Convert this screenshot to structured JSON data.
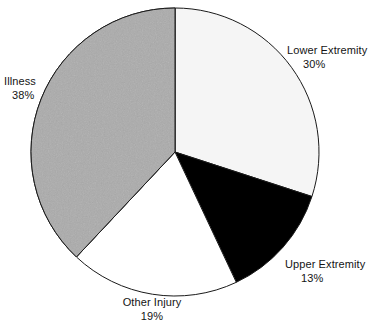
{
  "chart_data": {
    "type": "pie",
    "title": "",
    "subtitle": "",
    "xlabel": "",
    "ylabel": "",
    "legend_position": "none",
    "grid": false,
    "units": "percent",
    "start_angle_deg": 0,
    "direction": "clockwise",
    "total": 100,
    "categories": [
      "Lower Extremity",
      "Upper Extremity",
      "Other Injury",
      "Illness"
    ],
    "values": [
      30,
      13,
      19,
      38
    ],
    "slices": [
      {
        "label": "Lower Extremity",
        "value": 30,
        "value_text": "30%",
        "fill": "#f5f5f5",
        "stroke": "#1a1a1a",
        "pattern": "solid",
        "start_deg": 0,
        "end_deg": 108
      },
      {
        "label": "Upper Extremity",
        "value": 13,
        "value_text": "13%",
        "fill": "#000000",
        "stroke": "#1a1a1a",
        "pattern": "solid",
        "start_deg": 108,
        "end_deg": 154.8
      },
      {
        "label": "Other Injury",
        "value": 19,
        "value_text": "19%",
        "fill": "#ffffff",
        "stroke": "#1a1a1a",
        "pattern": "solid",
        "start_deg": 154.8,
        "end_deg": 223.2
      },
      {
        "label": "Illness",
        "value": 38,
        "value_text": "38%",
        "fill": "#ababab",
        "stroke": "#1a1a1a",
        "pattern": "noise",
        "start_deg": 223.2,
        "end_deg": 360
      }
    ],
    "geometry": {
      "center_x": 175,
      "center_y": 152,
      "radius": 144
    },
    "colors": {
      "background": "#ffffff",
      "outline": "#1a1a1a",
      "text": "#141414",
      "gray_fill": "#ababab",
      "offwhite_fill": "#f5f5f5",
      "black_fill": "#000000",
      "white_fill": "#ffffff"
    }
  },
  "labels": {
    "lower": {
      "name": "Lower Extremity",
      "pct": "30%"
    },
    "upper": {
      "name": "Upper Extremity",
      "pct": "13%"
    },
    "other": {
      "name": "Other Injury",
      "pct": "19%"
    },
    "illness": {
      "name": "Illness",
      "pct": "38%"
    }
  }
}
